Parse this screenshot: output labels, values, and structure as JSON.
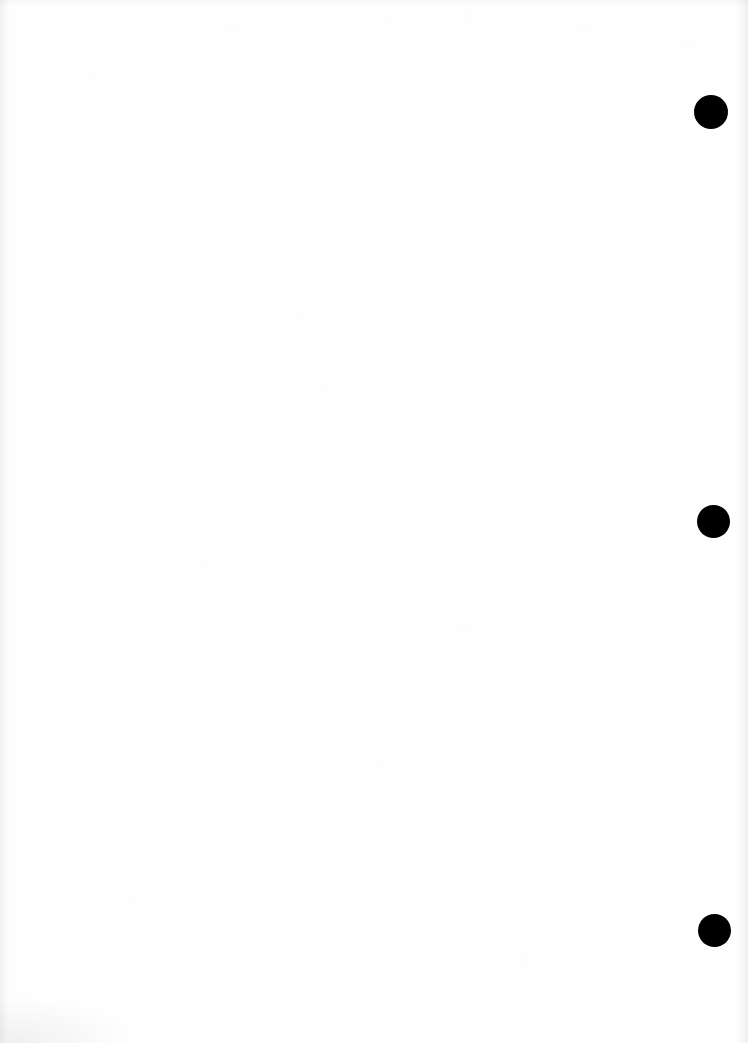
{
  "page": {
    "width": 748,
    "height": 1043,
    "background_color": "#fefefe",
    "content_text": ""
  },
  "marks": {
    "color": "#000000",
    "shape": "filled-circle",
    "count": 3,
    "dots": [
      {
        "name": "binder-dot-top",
        "cx": 711,
        "cy": 112,
        "d": 34
      },
      {
        "name": "binder-dot-middle",
        "cx": 713,
        "cy": 521,
        "d": 33
      },
      {
        "name": "binder-dot-bottom",
        "cx": 714,
        "cy": 930,
        "d": 33
      }
    ]
  },
  "artifacts": {
    "left_edge_shadow": "#82828720",
    "right_edge_shadow": "#8282871c",
    "bottom_left_smudge": "#7d7d8219"
  }
}
